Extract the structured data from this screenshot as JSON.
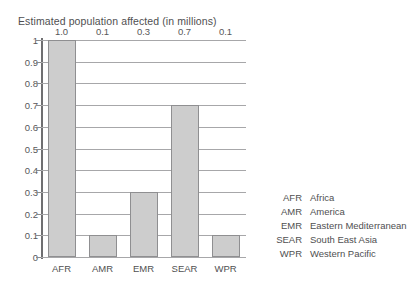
{
  "chart_data": {
    "type": "bar",
    "title": "Estimated population affected (in millions)",
    "xlabel": "",
    "ylabel": "",
    "categories": [
      "AFR",
      "AMR",
      "EMR",
      "SEAR",
      "WPR"
    ],
    "values": [
      1.0,
      0.1,
      0.3,
      0.7,
      0.1
    ],
    "data_labels": [
      "1.0",
      "0.1",
      "0.3",
      "0.7",
      "0.1"
    ],
    "ylim": [
      0,
      1
    ],
    "ytick_labels": [
      "0",
      "0.1",
      "0.2",
      "0.3",
      "0.4",
      "0.5",
      "0.6",
      "0.7",
      "0.8",
      "0.9",
      "1"
    ],
    "ytick_values": [
      0,
      0.1,
      0.2,
      0.3,
      0.4,
      0.5,
      0.6,
      0.7,
      0.8,
      0.9,
      1
    ],
    "grid": true,
    "legend_position": "right",
    "bar_fill_color": "#cdcdcd",
    "bar_border_color": "#8f8f91",
    "gridline_color": "#a7a7a9",
    "axis_color": "#6f6f71",
    "text_color": "#58585a"
  },
  "legend": {
    "rows": [
      {
        "code": "AFR",
        "description": "Africa"
      },
      {
        "code": "AMR",
        "description": "America"
      },
      {
        "code": "EMR",
        "description": "Eastern Mediterranean"
      },
      {
        "code": "SEAR",
        "description": "South East Asia"
      },
      {
        "code": "WPR",
        "description": "Western Pacific"
      }
    ]
  }
}
